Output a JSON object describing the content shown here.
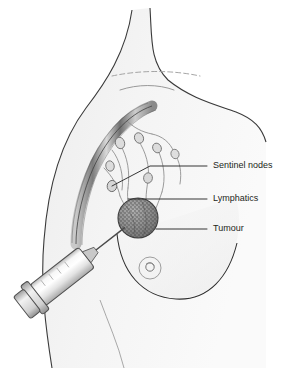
{
  "figure": {
    "width": 288,
    "height": 368,
    "background_color": "#ffffff",
    "body_fill_color": "#f2f2f2",
    "outline_color": "#231f20",
    "tumour_fill_color": "#8c8c8c",
    "vessel_color": "#9a9a9a",
    "syringe_fill_color": "#e8e8e8"
  },
  "labels": [
    {
      "id": "sentinel-nodes",
      "text": "Sentinel nodes",
      "text_x": 213,
      "text_y": 166,
      "leader": {
        "x1": 207,
        "y1": 166,
        "x2": 150,
        "y2": 166,
        "x3": 112,
        "y3": 186
      }
    },
    {
      "id": "lymphatics",
      "text": "Lymphatics",
      "text_x": 213,
      "text_y": 199,
      "leader": {
        "x1": 207,
        "y1": 199,
        "x2": 128,
        "y2": 199
      }
    },
    {
      "id": "tumour",
      "text": "Tumour",
      "text_x": 213,
      "text_y": 229,
      "leader": {
        "x1": 207,
        "y1": 229,
        "x2": 156,
        "y2": 229
      }
    }
  ],
  "anatomy": {
    "tumour": {
      "center_x": 138,
      "center_y": 218,
      "radius": 20,
      "texture": "stippled"
    },
    "nipple": {
      "center_x": 150,
      "center_y": 268,
      "outer_radius": 11,
      "inner_radius": 4
    },
    "axillary_vessel": {
      "description": "curved striped vessel bundle from axilla to shoulder"
    },
    "clavicle_lines": 2,
    "lymph_nodes_count": 7
  },
  "syringe": {
    "description": "syringe with needle entering tumour",
    "barrel_angle_deg": -38,
    "needle_tip_x": 124,
    "needle_tip_y": 231,
    "plunger_x": 30,
    "plunger_y": 320
  }
}
